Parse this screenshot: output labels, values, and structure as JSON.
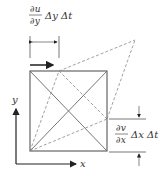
{
  "diagram": {
    "top_label": {
      "numerator": "∂u",
      "denominator": "∂y",
      "suffix": "Δy Δt"
    },
    "right_label": {
      "numerator": "∂v",
      "denominator": "∂x",
      "suffix": "Δx Δt"
    },
    "axes": {
      "x": "x",
      "y": "y"
    },
    "colors": {
      "stroke": "#555555",
      "dashed": "#888888",
      "arrow": "#222222"
    }
  }
}
